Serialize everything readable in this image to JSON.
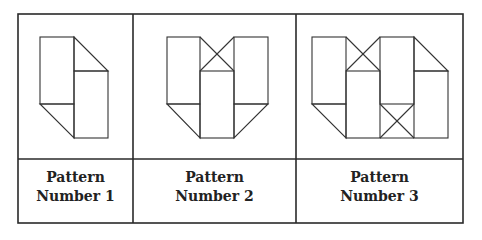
{
  "table": {
    "columns": [
      {
        "label_line1": "Pattern",
        "label_line2": "Number 1"
      },
      {
        "label_line1": "Pattern",
        "label_line2": "Number 2"
      },
      {
        "label_line1": "Pattern",
        "label_line2": "Number 3"
      }
    ]
  },
  "colors": {
    "line": "#2a2a2a",
    "background": "#ffffff"
  }
}
